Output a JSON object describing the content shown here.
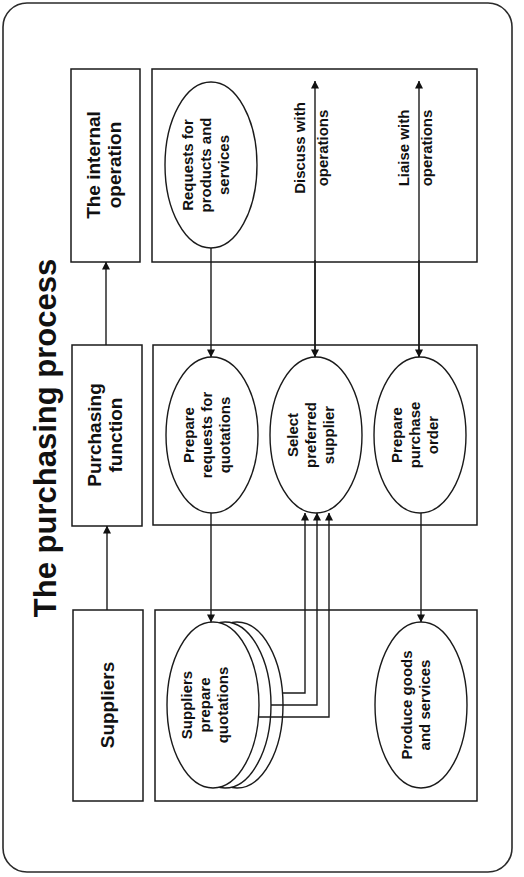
{
  "title": "The purchasing process",
  "lanes": [
    {
      "heading_lines": [
        "The internal",
        "operation"
      ]
    },
    {
      "heading_lines": [
        "Purchasing",
        "function"
      ]
    },
    {
      "heading_lines": [
        "Suppliers"
      ]
    }
  ],
  "nodes": {
    "requests": [
      "Requests for",
      "products and",
      "services"
    ],
    "prepare_rfq": [
      "Prepare",
      "requests for",
      "quotations"
    ],
    "select_supplier": [
      "Select",
      "preferred",
      "supplier"
    ],
    "prepare_po": [
      "Prepare",
      "purchase",
      "order"
    ],
    "suppliers_quote": [
      "Suppliers",
      "prepare",
      "quotations"
    ],
    "produce": [
      "Produce goods",
      "and services"
    ]
  },
  "flows": {
    "discuss": [
      "Discuss with",
      "operations"
    ],
    "liaise": [
      "Liaise with",
      "operations"
    ]
  },
  "colors": {
    "line": "#1a1a1a",
    "background": "#ffffff"
  }
}
